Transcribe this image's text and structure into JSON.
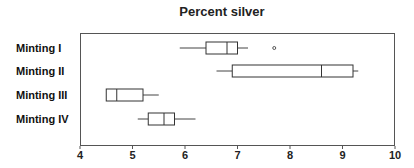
{
  "chart_data": {
    "type": "boxplot",
    "title": "Percent silver",
    "xlabel": "",
    "ylabel": "",
    "xlim": [
      4,
      10
    ],
    "xticks": [
      "4",
      "5",
      "6",
      "7",
      "8",
      "9",
      "10"
    ],
    "grid": false,
    "categories": [
      "Minting I",
      "Minting II",
      "Minting III",
      "Minting IV"
    ],
    "series": [
      {
        "name": "Minting I",
        "whisker_low": 5.9,
        "q1": 6.4,
        "median": 6.8,
        "q3": 7.0,
        "whisker_high": 7.2,
        "outliers": [
          7.7
        ]
      },
      {
        "name": "Minting II",
        "whisker_low": 6.6,
        "q1": 6.9,
        "median": 8.6,
        "q3": 9.2,
        "whisker_high": 9.3,
        "outliers": []
      },
      {
        "name": "Minting III",
        "whisker_low": 4.5,
        "q1": 4.5,
        "median": 4.7,
        "q3": 5.2,
        "whisker_high": 5.5,
        "outliers": []
      },
      {
        "name": "Minting IV",
        "whisker_low": 5.1,
        "q1": 5.3,
        "median": 5.6,
        "q3": 5.8,
        "whisker_high": 6.2,
        "outliers": []
      }
    ]
  }
}
